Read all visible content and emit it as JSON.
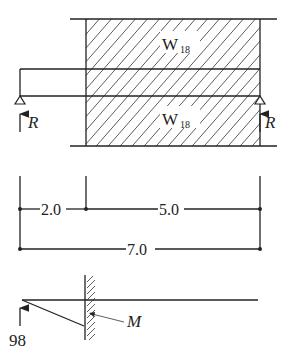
{
  "diagram": {
    "type": "beam-load-diagram",
    "load_labels": {
      "upper": {
        "base": "W",
        "sub": "18"
      },
      "lower": {
        "base": "W",
        "sub": "18"
      }
    },
    "reactions": {
      "left": "R",
      "right": "R"
    },
    "dimensions": {
      "segment_left": "2.0",
      "segment_right": "5.0",
      "total": "7.0"
    },
    "free_body": {
      "force_value": "98",
      "moment_label": "M"
    }
  }
}
